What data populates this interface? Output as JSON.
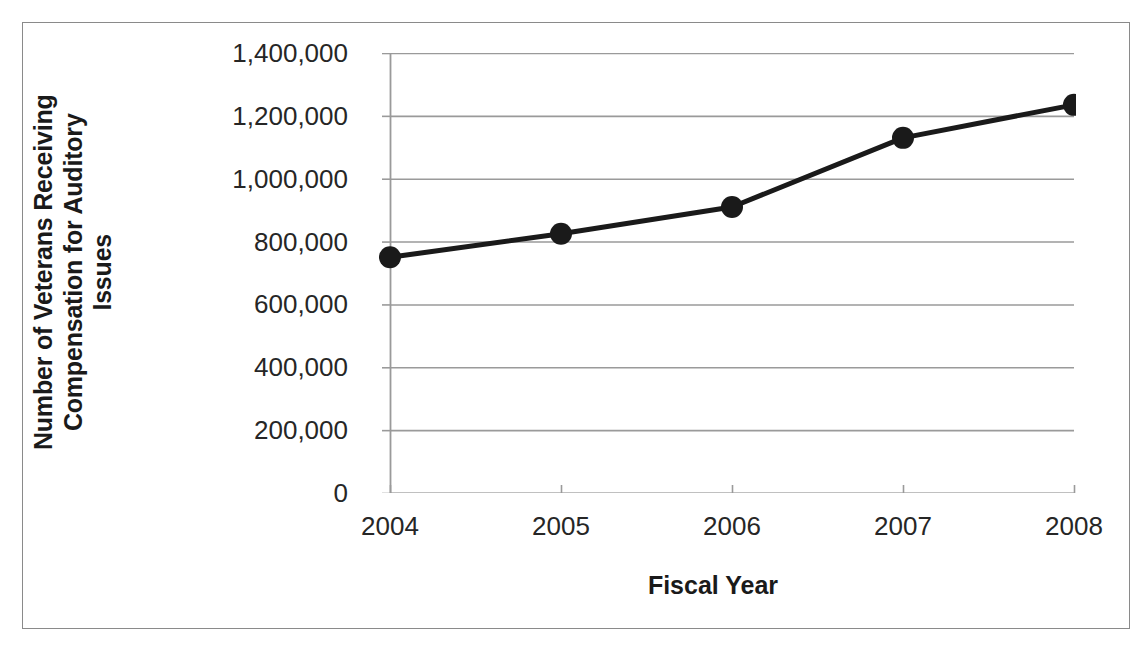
{
  "chart_data": {
    "type": "line",
    "title": "",
    "xlabel": "Fiscal Year",
    "ylabel": "Number of Veterans Receiving Compensation for Auditory Issues",
    "ylabel_lines": [
      "Number of Veterans Receiving",
      "Compensation for Auditory",
      "Issues"
    ],
    "categories": [
      "2004",
      "2005",
      "2006",
      "2007",
      "2008"
    ],
    "values": [
      750000,
      825000,
      910000,
      1130000,
      1235000
    ],
    "series": [
      {
        "name": "Veterans receiving compensation for auditory issues",
        "values": [
          750000,
          825000,
          910000,
          1130000,
          1235000
        ]
      }
    ],
    "ylim": [
      0,
      1400000
    ],
    "ytick_values": [
      0,
      200000,
      400000,
      600000,
      800000,
      1000000,
      1200000,
      1400000
    ],
    "ytick_labels": [
      "0",
      "200,000",
      "400,000",
      "600,000",
      "800,000",
      "1,000,000",
      "1,200,000",
      "1,400,000"
    ],
    "xtick_labels": [
      "2004",
      "2005",
      "2006",
      "2007",
      "2008"
    ],
    "grid": "horizontal",
    "legend": "none",
    "colors": {
      "line": "#1a1a1a",
      "marker": "#1a1a1a",
      "gridline": "#9a9a9a",
      "axis": "#9a9a9a",
      "border": "#8a8a8a",
      "text": "#262626",
      "title_text": "#1a1a1a",
      "background": "#ffffff"
    },
    "style": {
      "line_width": 5,
      "marker_radius": 11,
      "marker_shape": "circle"
    }
  }
}
